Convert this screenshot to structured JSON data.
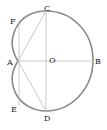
{
  "diagram": {
    "type": "cardioid construction",
    "labels": {
      "A": "A",
      "B": "B",
      "C": "C",
      "D": "D",
      "E": "E",
      "F": "F",
      "O": "O"
    },
    "colors": {
      "curve": "#8a8a8a",
      "lines": "#b8b8b8",
      "text": "#222222",
      "background": "#ffffff"
    }
  }
}
